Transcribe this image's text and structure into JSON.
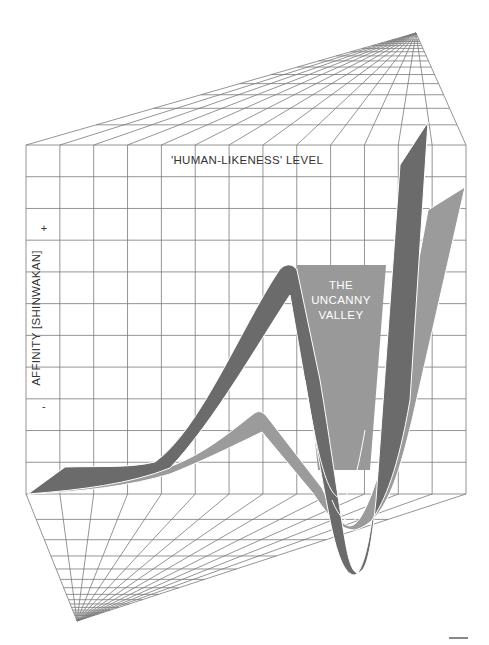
{
  "diagram": {
    "title_axis_x": "'HUMAN-LIKENESS' LEVEL",
    "axis_y_label": "AFFINITY [SHINWAKAN]",
    "axis_y_plus": "+",
    "axis_y_minus": "-",
    "region_label_lines": [
      "THE",
      "UNCANNY",
      "VALLEY"
    ],
    "colors": {
      "background": "#ffffff",
      "grid": "#7a7a7a",
      "dark_ribbon": "#6b6b6b",
      "light_ribbon": "#9b9b9b",
      "valley_region": "#999999",
      "ribbon_edge": "#ffffff"
    },
    "grid": {
      "back_panel": {
        "left": 26,
        "right": 466,
        "top": 145,
        "bottom": 494,
        "columns": 13,
        "rows": 11
      },
      "top_vanishing_point": [
        416,
        33
      ],
      "bottom_vanishing_point": [
        77,
        621
      ]
    },
    "series": [
      {
        "name": "moving",
        "style": "dark",
        "description": "upper curve: rises to peak, plunges into uncanny valley, rises steeply"
      },
      {
        "name": "still",
        "style": "light",
        "description": "lower curve: gentle rise, smaller peak, shallower valley, rises steeply"
      }
    ]
  },
  "chart_data": {
    "type": "line",
    "title": "The Uncanny Valley",
    "xlabel": "'HUMAN-LIKENESS' LEVEL",
    "ylabel": "AFFINITY [SHINWAKAN]",
    "y_ticks": [
      "+",
      "-"
    ],
    "annotations": [
      "THE UNCANNY VALLEY"
    ],
    "grid": true,
    "x": [
      0,
      10,
      20,
      30,
      40,
      50,
      60,
      70,
      75,
      80,
      85,
      90,
      95,
      100
    ],
    "series": [
      {
        "name": "Moving (dark)",
        "values": [
          0,
          2,
          5,
          12,
          30,
          55,
          75,
          40,
          -40,
          -100,
          -60,
          20,
          80,
          120
        ]
      },
      {
        "name": "Still (light)",
        "values": [
          0,
          3,
          6,
          10,
          16,
          25,
          30,
          10,
          -20,
          -60,
          -30,
          20,
          60,
          100
        ]
      }
    ],
    "legend": "none"
  },
  "footer": {
    "mark": ""
  }
}
